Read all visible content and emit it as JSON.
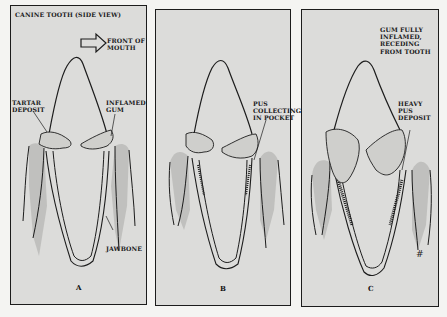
{
  "figure": {
    "title": "CANINE TOOTH (SIDE VIEW)",
    "direction_label": "FRONT OF\nMOUTH",
    "direction_icon": "arrow-right-outline-icon",
    "colors": {
      "page_background": "#f4f4f2",
      "panel_fill": "#dcdcda",
      "outline": "#1c1c1c",
      "gum_shade": "#b9b9b7",
      "tartar_fill": "#cfcfcc"
    },
    "panels": [
      {
        "letter": "A",
        "labels": {
          "tartar": "TARTAR\nDEPOSIT",
          "gum": "INFLAMED\nGUM",
          "bone": "JAWBONE"
        }
      },
      {
        "letter": "B",
        "labels": {
          "pus": "PUS\nCOLLECTING\nIN POCKET"
        }
      },
      {
        "letter": "C",
        "labels": {
          "gum": "GUM FULLY\nINFLAMED,\nRECEDING\nFROM TOOTH",
          "pus": "HEAVY\nPUS\nDEPOSIT"
        }
      }
    ]
  }
}
